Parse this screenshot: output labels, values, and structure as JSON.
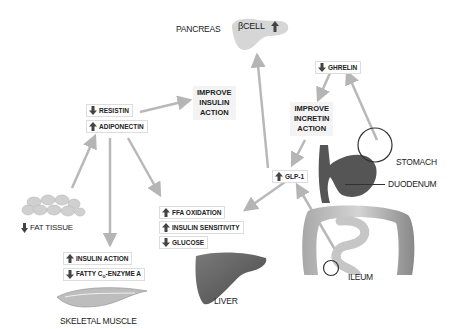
{
  "organs": {
    "pancreas": "PANCREAS",
    "beta_cell": "βCELL",
    "stomach": "STOMACH",
    "duodenum": "DUODENUM",
    "ileum": "ILEUM",
    "liver": "LIVER",
    "skeletal_muscle": "SKELETAL MUSCLE",
    "fat_tissue": "FAT TISSUE"
  },
  "actions": {
    "insulin": [
      "IMPROVE",
      "INSULIN",
      "ACTION"
    ],
    "incretin": [
      "IMPROVE",
      "INCRETIN",
      "ACTION"
    ]
  },
  "markers": {
    "resistin": {
      "label": "RESISTIN",
      "direction": "down"
    },
    "adiponectin": {
      "label": "ADIPONECTIN",
      "direction": "up"
    },
    "ghrelin": {
      "label": "GHRELIN",
      "direction": "down"
    },
    "glp1": {
      "label": "GLP-1",
      "direction": "up"
    },
    "ffa_oxidation": {
      "label": "FFA OXIDATION",
      "direction": "up"
    },
    "insulin_sensitivity": {
      "label": "INSULIN SENSITIVITY",
      "direction": "up"
    },
    "glucose": {
      "label": "GLUCOSE",
      "direction": "down"
    },
    "insulin_action": {
      "label": "INSULIN ACTION",
      "direction": "up"
    },
    "fatty_coa_prefix": {
      "label": "FATTY C",
      "direction": "down"
    },
    "fatty_coa_sub": "o",
    "fatty_coa_suffix": "-ENZYME A",
    "beta_cell_direction": "up",
    "fat_tissue_direction": "down"
  },
  "colors": {
    "arrow_line": "#b5b5b5",
    "organ_dark": "#5a5a5a",
    "organ_light": "#c8c8c8"
  }
}
